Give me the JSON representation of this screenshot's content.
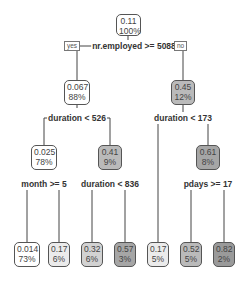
{
  "tree": {
    "colors": {
      "c0": "#ffffff",
      "c1": "#ebebeb",
      "c2": "#d2d2d2",
      "c3": "#bababa",
      "c4": "#a6a6a6",
      "line": "#444444"
    },
    "root": {
      "value": "0.11",
      "pct": "100%"
    },
    "root_split": {
      "label": "nr.employed >= 5088",
      "yes": "yes",
      "no": "no"
    },
    "n2": {
      "value": "0.067",
      "pct": "88%"
    },
    "n2_split": "duration < 526",
    "n3": {
      "value": "0.45",
      "pct": "12%"
    },
    "n3_split": "duration < 173",
    "n4": {
      "value": "0.025",
      "pct": "78%"
    },
    "n4_split": "month >= 5",
    "n5": {
      "value": "0.41",
      "pct": "9%"
    },
    "n5_split": "duration < 836",
    "n7": {
      "value": "0.61",
      "pct": "8%"
    },
    "n7_split": "pdays >= 17",
    "leaves": [
      {
        "value": "0.014",
        "pct": "73%"
      },
      {
        "value": "0.17",
        "pct": "6%"
      },
      {
        "value": "0.32",
        "pct": "6%"
      },
      {
        "value": "0.57",
        "pct": "3%"
      },
      {
        "value": "0.17",
        "pct": "5%"
      },
      {
        "value": "0.52",
        "pct": "5%"
      },
      {
        "value": "0.82",
        "pct": "2%"
      }
    ]
  }
}
